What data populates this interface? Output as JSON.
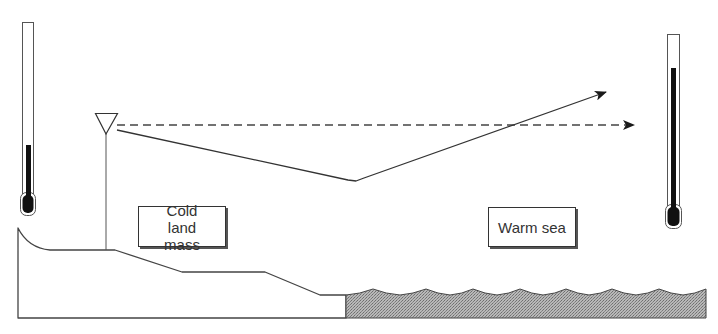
{
  "diagram": {
    "labels": {
      "land": "Cold land mass",
      "sea": "Warm sea"
    },
    "elements": {
      "left_thermometer": {
        "state": "low",
        "meaning": "cold"
      },
      "right_thermometer": {
        "state": "high",
        "meaning": "warm"
      },
      "observer": {
        "icon": "triangle-observer-icon"
      },
      "dashed_ray": {
        "style": "dashed",
        "direction": "straight"
      },
      "refracted_ray": {
        "style": "solid",
        "direction": "bent-down-then-up"
      }
    },
    "colors": {
      "line": "#444444",
      "mercury": "#111111",
      "sea_fill": "#9a9a9a",
      "background": "#ffffff"
    }
  }
}
